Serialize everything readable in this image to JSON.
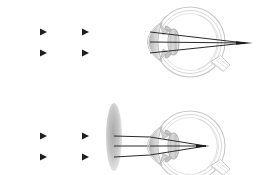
{
  "figure": {
    "width": 258,
    "height": 175,
    "background": "#ffffff",
    "panels": [
      {
        "id": "uncorrected",
        "caption": "",
        "description": "Parallel light rays entering an uncorrected hyperopic eye converge at a focal point behind the retina",
        "eye": {
          "center_x": 190,
          "center_y": 42,
          "radius": 35,
          "sclera_color": "#d8d8d8",
          "interior_color": "#ffffff",
          "lens_color": "#b8b8b8",
          "cornea_color": "#c8c8c8"
        },
        "rays": {
          "count": 3,
          "color": "#303030",
          "y_values": [
            32,
            42,
            53
          ],
          "start_x": 14,
          "arrow_positions": [
            43,
            85
          ],
          "arrows_on_rays": [
            0,
            2
          ],
          "focus_x": 245,
          "focus_y": 43
        },
        "corrective_lens": null
      },
      {
        "id": "corrected",
        "caption": "",
        "description": "A converging (convex) spectacle lens placed in front of the eye brings the parallel rays to focus on the retina",
        "eye": {
          "center_x": 190,
          "center_y": 146,
          "radius": 35,
          "sclera_color": "#d8d8d8",
          "interior_color": "#ffffff",
          "lens_color": "#b8b8b8",
          "cornea_color": "#c8c8c8"
        },
        "rays": {
          "count": 3,
          "color": "#303030",
          "y_values": [
            136,
            146,
            157
          ],
          "start_x": 14,
          "arrow_positions": [
            43,
            85
          ],
          "arrows_on_rays": [
            0,
            2
          ],
          "focus_x": 206,
          "focus_y": 146
        },
        "corrective_lens": {
          "type": "converging-convex",
          "center_x": 114,
          "center_y": 137,
          "half_width": 8,
          "half_height": 34,
          "color": "#bcbcbc"
        }
      }
    ]
  },
  "colors": {
    "ray": "#303030",
    "outline": "#b4b4b4",
    "lens_fill": "#c0c0c0",
    "background": "#ffffff"
  }
}
